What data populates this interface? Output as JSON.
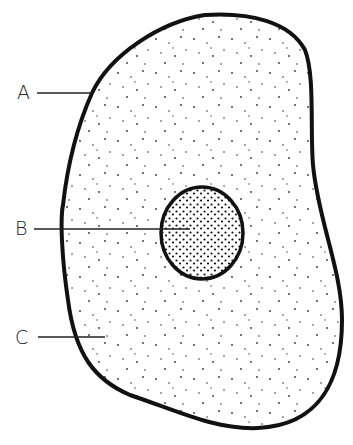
{
  "diagram": {
    "type": "cell-structure",
    "labels": [
      {
        "id": "A",
        "text": "A",
        "target": "cell-membrane",
        "x": 17,
        "y": 84,
        "line": {
          "x1": 37,
          "y1": 93,
          "x2": 92,
          "y2": 93
        }
      },
      {
        "id": "B",
        "text": "B",
        "target": "nucleus",
        "x": 15,
        "y": 220,
        "line": {
          "x1": 34,
          "y1": 229,
          "x2": 190,
          "y2": 229
        }
      },
      {
        "id": "C",
        "text": "C",
        "target": "cytoplasm",
        "x": 15,
        "y": 329,
        "line": {
          "x1": 38,
          "y1": 337,
          "x2": 105,
          "y2": 337
        }
      }
    ],
    "colors": {
      "outline": "#111111",
      "stipple": "#222222",
      "label": "#222222",
      "background": "#ffffff"
    }
  }
}
